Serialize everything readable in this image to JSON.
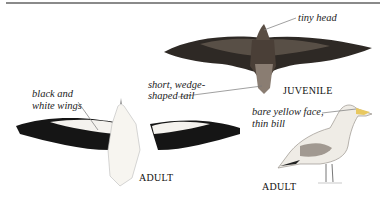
{
  "figure": {
    "annotations": {
      "tiny_head": "tiny head",
      "tail_line1": "short, wedge-",
      "tail_line2": "shaped tail",
      "wings_line1": "black and",
      "wings_line2": "white wings",
      "face_line1": "bare yellow face,",
      "face_line2": "thin bill"
    },
    "captions": {
      "juvenile": "JUVENILE",
      "adult_flight": "ADULT",
      "adult_perched": "ADULT"
    },
    "colors": {
      "ink": "#111111",
      "juvenile_plumage": "#3a332d",
      "adult_white": "#f4f2ee",
      "bill_yellow": "#e8c860",
      "rule": "#8a8a8a"
    }
  }
}
